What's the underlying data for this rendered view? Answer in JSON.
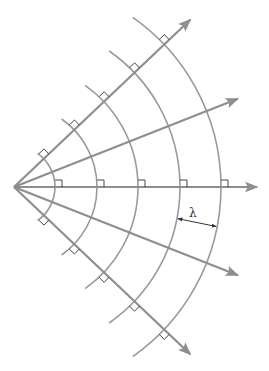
{
  "diagram": {
    "source": {
      "x": 14,
      "y": 187
    },
    "wavefront_radii": [
      41,
      83,
      124,
      166,
      207
    ],
    "ray_angles_deg": [
      -43.5,
      -21.5,
      0,
      21.5,
      43.5
    ],
    "ray_length": 243,
    "arc_half_span_deg": 55,
    "colors": {
      "ray": "#8e8e8e",
      "wavefront": "#9a9a9a",
      "right_angle_mark": "#333333",
      "label": "#333333"
    },
    "wavelength_label": {
      "text": "λ",
      "x": 189,
      "y": 217
    },
    "wavelength_arrow": {
      "from_radius": 166,
      "to_radius": 207,
      "angle_deg": 11
    }
  }
}
